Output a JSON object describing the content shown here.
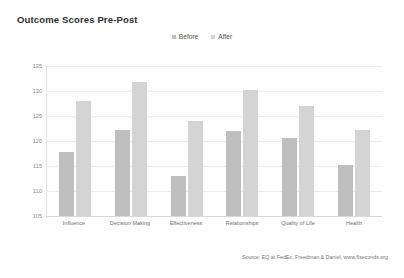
{
  "title": "Outcome Scores Pre-Post",
  "legend": {
    "position": "top-center",
    "entries": [
      {
        "label": "Before",
        "color": "#bfbfbf",
        "icon": "legend-swatch-icon"
      },
      {
        "label": "After",
        "color": "#d4d4d4",
        "icon": "legend-swatch-icon"
      }
    ]
  },
  "source": "Source: EQ at FedEx, Freedman & Daniel, www.6seconds.org",
  "chart_data": {
    "type": "bar",
    "title": "Outcome Scores Pre-Post",
    "xlabel": "",
    "ylabel": "",
    "ylim": [
      105,
      135
    ],
    "yticks": [
      105,
      110,
      115,
      120,
      125,
      130,
      135
    ],
    "grid": true,
    "legend_position": "top-center",
    "categories": [
      "Influence",
      "Decision Making",
      "Effectiveness",
      "Relationships",
      "Quality of Life",
      "Health"
    ],
    "series": [
      {
        "name": "Before",
        "color": "#bfbfbf",
        "values": [
          117.8,
          122.2,
          113.0,
          122.1,
          120.6,
          115.2
        ]
      },
      {
        "name": "After",
        "color": "#d4d4d4",
        "values": [
          128.0,
          131.8,
          124.0,
          130.3,
          127.0,
          122.2
        ]
      }
    ],
    "annotations": [
      "Source: EQ at FedEx, Freedman & Daniel, www.6seconds.org"
    ]
  }
}
